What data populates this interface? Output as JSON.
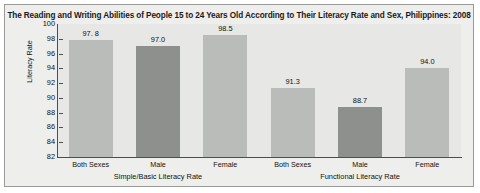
{
  "chart_data": {
    "type": "bar",
    "title": "The Reading and Writing Abilities of People 15 to 24 Years Old According to Their Literacy Rate and Sex, Philippines: 2008",
    "xlabel": "",
    "ylabel": "Literacy Rate",
    "ylim": [
      82,
      100
    ],
    "ytick_step": 2,
    "yticks": [
      "100",
      "98",
      "96",
      "94",
      "92",
      "90",
      "88",
      "86",
      "84",
      "82"
    ],
    "grid": false,
    "legend": "none",
    "groups": [
      {
        "name": "Simple/Basic Literacy Rate",
        "categories": [
          "Both Sexes",
          "Male",
          "Female"
        ],
        "values": [
          97.8,
          97.0,
          98.5
        ],
        "value_labels": [
          "97. 8",
          "97.0",
          "98.5"
        ]
      },
      {
        "name": "Functional Literacy Rate",
        "categories": [
          "Both Sexes",
          "Male",
          "Female"
        ],
        "values": [
          91.3,
          88.7,
          94.0
        ],
        "value_labels": [
          "91.3",
          "88.7",
          "94.0"
        ]
      }
    ],
    "series_colors": {
      "both_sexes": "#b9bcb9",
      "male": "#8d908d",
      "female": "#b9bcb9"
    },
    "colors": {
      "plot_background": "#e7e7e5",
      "panel_background": "#eeeeec",
      "axis": "#4d4d4d",
      "border": "#9a9a98",
      "text": "#111111"
    }
  }
}
